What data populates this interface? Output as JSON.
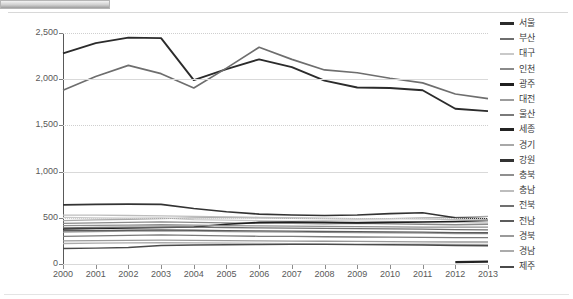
{
  "axes": {
    "y_ticks": [
      "0",
      "500",
      "1,000",
      "1,500",
      "2,000",
      "2,500"
    ],
    "x_ticks": [
      "2000",
      "2001",
      "2002",
      "2003",
      "2004",
      "2005",
      "2006",
      "2007",
      "2008",
      "2009",
      "2010",
      "2011",
      "2012",
      "2013"
    ]
  },
  "legend": {
    "items": [
      {
        "label": "서울",
        "color": "#2b2b2b"
      },
      {
        "label": "부산",
        "color": "#6e6e6e"
      },
      {
        "label": "대구",
        "color": "#c9c9c9"
      },
      {
        "label": "인천",
        "color": "#8a8a8a"
      },
      {
        "label": "광주",
        "color": "#1f1f1f"
      },
      {
        "label": "대전",
        "color": "#9c9c9c"
      },
      {
        "label": "울산",
        "color": "#7a7a7a"
      },
      {
        "label": "세종",
        "color": "#232323"
      },
      {
        "label": "경기",
        "color": "#a8a8a8"
      },
      {
        "label": "강원",
        "color": "#333333"
      },
      {
        "label": "충북",
        "color": "#8f8f8f"
      },
      {
        "label": "충남",
        "color": "#bdbdbd"
      },
      {
        "label": "전북",
        "color": "#707070"
      },
      {
        "label": "전남",
        "color": "#5c5c5c"
      },
      {
        "label": "경북",
        "color": "#9a9a9a"
      },
      {
        "label": "경남",
        "color": "#ababab"
      },
      {
        "label": "제주",
        "color": "#4a4a4a"
      }
    ]
  },
  "chart_data": {
    "type": "line",
    "title": "",
    "xlabel": "",
    "ylabel": "",
    "ylim": [
      0,
      2500
    ],
    "ygrid": true,
    "legend_position": "right",
    "x": [
      2000,
      2001,
      2002,
      2003,
      2004,
      2005,
      2006,
      2007,
      2008,
      2009,
      2010,
      2011,
      2012,
      2013
    ],
    "series": [
      {
        "name": "서울",
        "color": "#2b2b2b",
        "width": 1.9,
        "values": [
          2280,
          2390,
          2450,
          2445,
          1990,
          2110,
          2215,
          2130,
          1985,
          1910,
          1905,
          1880,
          1680,
          1655
        ]
      },
      {
        "name": "부산",
        "color": "#6e6e6e",
        "width": 1.7,
        "values": [
          1880,
          2030,
          2150,
          2060,
          1905,
          2120,
          2345,
          2215,
          2100,
          2070,
          2010,
          1960,
          1840,
          1790
        ]
      },
      {
        "name": "대구",
        "color": "#c9c9c9",
        "width": 1.3,
        "values": [
          505,
          500,
          495,
          500,
          480,
          475,
          470,
          465,
          470,
          465,
          460,
          455,
          450,
          445
        ]
      },
      {
        "name": "인천",
        "color": "#8a8a8a",
        "width": 1.3,
        "values": [
          440,
          445,
          450,
          455,
          450,
          445,
          440,
          440,
          435,
          440,
          435,
          430,
          425,
          430
        ]
      },
      {
        "name": "광주",
        "color": "#1f1f1f",
        "width": 1.6,
        "values": [
          380,
          385,
          390,
          395,
          400,
          430,
          450,
          455,
          450,
          445,
          450,
          455,
          460,
          470
        ]
      },
      {
        "name": "대전",
        "color": "#9c9c9c",
        "width": 1.3,
        "values": [
          345,
          350,
          355,
          360,
          355,
          350,
          348,
          345,
          342,
          340,
          338,
          335,
          330,
          330
        ]
      },
      {
        "name": "울산",
        "color": "#7a7a7a",
        "width": 1.3,
        "values": [
          300,
          305,
          310,
          315,
          310,
          305,
          300,
          298,
          295,
          292,
          290,
          288,
          285,
          285
        ]
      },
      {
        "name": "세종",
        "color": "#232323",
        "width": 2.2,
        "values": [
          null,
          null,
          null,
          null,
          null,
          null,
          null,
          null,
          null,
          null,
          null,
          null,
          20,
          25
        ]
      },
      {
        "name": "경기",
        "color": "#a8a8a8",
        "width": 1.3,
        "values": [
          470,
          478,
          482,
          490,
          500,
          505,
          500,
          495,
          490,
          488,
          492,
          500,
          505,
          515
        ]
      },
      {
        "name": "강원",
        "color": "#333333",
        "width": 1.6,
        "values": [
          640,
          645,
          648,
          645,
          600,
          565,
          540,
          530,
          525,
          530,
          545,
          555,
          500,
          490
        ]
      },
      {
        "name": "충북",
        "color": "#8f8f8f",
        "width": 1.3,
        "values": [
          415,
          418,
          420,
          425,
          420,
          415,
          412,
          410,
          408,
          405,
          402,
          400,
          398,
          400
        ]
      },
      {
        "name": "충남",
        "color": "#bdbdbd",
        "width": 1.3,
        "values": [
          530,
          528,
          525,
          520,
          515,
          510,
          505,
          500,
          495,
          492,
          490,
          488,
          480,
          475
        ]
      },
      {
        "name": "전북",
        "color": "#707070",
        "width": 1.3,
        "values": [
          390,
          395,
          398,
          400,
          398,
          395,
          390,
          388,
          385,
          382,
          380,
          378,
          372,
          370
        ]
      },
      {
        "name": "전남",
        "color": "#5c5c5c",
        "width": 1.3,
        "values": [
          360,
          362,
          365,
          368,
          365,
          362,
          358,
          355,
          352,
          350,
          348,
          345,
          340,
          338
        ]
      },
      {
        "name": "경북",
        "color": "#9a9a9a",
        "width": 1.3,
        "values": [
          250,
          252,
          255,
          258,
          255,
          252,
          250,
          248,
          246,
          244,
          242,
          240,
          238,
          238
        ]
      },
      {
        "name": "경남",
        "color": "#ababab",
        "width": 1.3,
        "values": [
          222,
          225,
          228,
          230,
          228,
          225,
          222,
          220,
          218,
          216,
          215,
          214,
          212,
          212
        ]
      },
      {
        "name": "제주",
        "color": "#4a4a4a",
        "width": 1.4,
        "values": [
          168,
          172,
          178,
          200,
          205,
          208,
          210,
          212,
          212,
          210,
          208,
          205,
          200,
          198
        ]
      }
    ]
  }
}
